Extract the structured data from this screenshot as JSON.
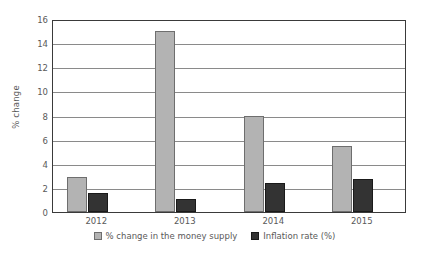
{
  "chart_data": {
    "type": "bar",
    "title": "",
    "subtitle": "",
    "xlabel": "",
    "ylabel": "% change",
    "categories": [
      "2012",
      "2013",
      "2014",
      "2015"
    ],
    "series": [
      {
        "name": "% change in the money supply",
        "color": "#b3b3b3",
        "values": [
          2.9,
          15.0,
          7.95,
          5.45
        ]
      },
      {
        "name": "Inflation rate (%)",
        "color": "#333333",
        "values": [
          1.6,
          1.1,
          2.4,
          2.75
        ]
      }
    ],
    "ylim": [
      0,
      16
    ],
    "ytick_labels": [
      "0",
      "2",
      "4",
      "6",
      "8",
      "10",
      "12",
      "14",
      "16"
    ],
    "ytick_values": [
      0,
      2,
      4,
      6,
      8,
      10,
      12,
      14,
      16
    ],
    "grid": "horizontal",
    "legend_position": "bottom",
    "axis_color": "#3a3a3a",
    "grid_color": "#8a8a8a",
    "text_color": "#595959",
    "background": "#ffffff"
  }
}
